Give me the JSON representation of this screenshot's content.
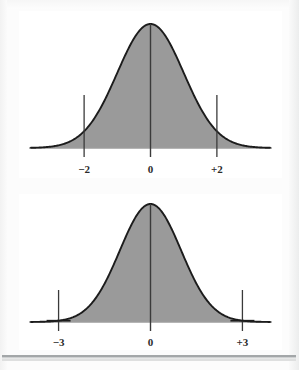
{
  "figure": {
    "title": "",
    "background_color": "#fcfcfc",
    "panel_color": "#ffffff",
    "curve_fill_color": "#9a9a9a",
    "curve_stroke_color": "#1c1c1c",
    "axis_color": "#9b9b9b",
    "tick_color": "#3a3a3a",
    "label_color": "#2b2b2b"
  },
  "charts": [
    {
      "id": "normal-curve-2sd",
      "type": "area",
      "title": "",
      "xlabel": "",
      "ylabel": "",
      "xlim": [
        -3.6,
        3.6
      ],
      "ylim": [
        0,
        1.0
      ],
      "grid": false,
      "legend": null,
      "distribution": "standard normal",
      "tick_labels": [
        "−2",
        "0",
        "+2"
      ],
      "tick_values": [
        -2,
        0,
        2
      ],
      "center_line_at": 0,
      "marker_lines_at": [
        -2,
        2
      ],
      "marker_style": "vertical-line",
      "x": [
        -3.6,
        -3.3,
        -3.0,
        -2.7,
        -2.4,
        -2.1,
        -1.8,
        -1.5,
        -1.2,
        -0.9,
        -0.6,
        -0.3,
        0.0,
        0.3,
        0.6,
        0.9,
        1.2,
        1.5,
        1.8,
        2.1,
        2.4,
        2.7,
        3.0,
        3.3,
        3.6
      ],
      "y": [
        0.0018,
        0.0042,
        0.0111,
        0.0267,
        0.0584,
        0.116,
        0.2096,
        0.3247,
        0.4868,
        0.667,
        0.8353,
        0.956,
        1.0,
        0.956,
        0.8353,
        0.667,
        0.4868,
        0.3247,
        0.2096,
        0.116,
        0.0584,
        0.0267,
        0.0111,
        0.0042,
        0.0018
      ]
    },
    {
      "id": "normal-curve-3sd",
      "type": "area",
      "title": "",
      "xlabel": "",
      "ylabel": "",
      "xlim": [
        -3.9,
        3.9
      ],
      "ylim": [
        0,
        1.0
      ],
      "grid": false,
      "legend": null,
      "distribution": "standard normal",
      "tick_labels": [
        "−3",
        "0",
        "+3"
      ],
      "tick_values": [
        -3,
        0,
        3
      ],
      "center_line_at": 0,
      "marker_lines_at": [
        -3,
        3
      ],
      "marker_style": "cross",
      "x": [
        -3.9,
        -3.6,
        -3.3,
        -3.0,
        -2.7,
        -2.4,
        -2.1,
        -1.8,
        -1.5,
        -1.2,
        -0.9,
        -0.6,
        -0.3,
        0.0,
        0.3,
        0.6,
        0.9,
        1.2,
        1.5,
        1.8,
        2.1,
        2.4,
        2.7,
        3.0,
        3.3,
        3.6,
        3.9
      ],
      "y": [
        0.0005,
        0.0018,
        0.0042,
        0.0111,
        0.0267,
        0.0584,
        0.116,
        0.2096,
        0.3247,
        0.4868,
        0.667,
        0.8353,
        0.956,
        1.0,
        0.956,
        0.8353,
        0.667,
        0.4868,
        0.3247,
        0.2096,
        0.116,
        0.0584,
        0.0267,
        0.0111,
        0.0042,
        0.0018,
        0.0005
      ]
    }
  ],
  "chart_data": [
    {
      "type": "area",
      "title": "",
      "xlabel": "",
      "ylabel": "",
      "categories": [
        "−2",
        "0",
        "+2"
      ],
      "series": [
        {
          "name": "standard normal density",
          "x": [
            -3.6,
            -3.3,
            -3.0,
            -2.7,
            -2.4,
            -2.1,
            -1.8,
            -1.5,
            -1.2,
            -0.9,
            -0.6,
            -0.3,
            0.0,
            0.3,
            0.6,
            0.9,
            1.2,
            1.5,
            1.8,
            2.1,
            2.4,
            2.7,
            3.0,
            3.3,
            3.6
          ],
          "values": [
            0.0018,
            0.0042,
            0.0111,
            0.0267,
            0.0584,
            0.116,
            0.2096,
            0.3247,
            0.4868,
            0.667,
            0.8353,
            0.956,
            1.0,
            0.956,
            0.8353,
            0.667,
            0.4868,
            0.3247,
            0.2096,
            0.116,
            0.0584,
            0.0267,
            0.0111,
            0.0042,
            0.0018
          ]
        }
      ],
      "xlim": [
        -3.6,
        3.6
      ],
      "ylim": [
        0,
        1.0
      ],
      "grid": false,
      "legend": null,
      "annotations": [
        "−2",
        "0",
        "+2"
      ]
    },
    {
      "type": "area",
      "title": "",
      "xlabel": "",
      "ylabel": "",
      "categories": [
        "−3",
        "0",
        "+3"
      ],
      "series": [
        {
          "name": "standard normal density",
          "x": [
            -3.9,
            -3.6,
            -3.3,
            -3.0,
            -2.7,
            -2.4,
            -2.1,
            -1.8,
            -1.5,
            -1.2,
            -0.9,
            -0.6,
            -0.3,
            0.0,
            0.3,
            0.6,
            0.9,
            1.2,
            1.5,
            1.8,
            2.1,
            2.4,
            2.7,
            3.0,
            3.3,
            3.6,
            3.9
          ],
          "values": [
            0.0005,
            0.0018,
            0.0042,
            0.0111,
            0.0267,
            0.0584,
            0.116,
            0.2096,
            0.3247,
            0.4868,
            0.667,
            0.8353,
            0.956,
            1.0,
            0.956,
            0.8353,
            0.667,
            0.4868,
            0.3247,
            0.2096,
            0.116,
            0.0584,
            0.0267,
            0.0111,
            0.0042,
            0.0018,
            0.0005
          ]
        }
      ],
      "xlim": [
        -3.9,
        3.9
      ],
      "ylim": [
        0,
        1.0
      ],
      "grid": false,
      "legend": null,
      "annotations": [
        "−3",
        "0",
        "+3"
      ]
    }
  ],
  "labels": {
    "top_left": "−2",
    "top_center": "0",
    "top_right": "+2",
    "bottom_left": "−3",
    "bottom_center": "0",
    "bottom_right": "+3"
  }
}
